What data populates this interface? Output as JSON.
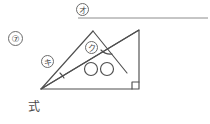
{
  "page": {
    "background_color": "#ffffff",
    "ink_color": "#4a4a4a",
    "width": 210,
    "height": 124
  },
  "answer_line": {
    "marker_label": "オ",
    "marker_name": "circled-katakana-o",
    "rule_x1": 78,
    "rule_x2": 208,
    "rule_y": 18
  },
  "problem": {
    "number_label": "⑦",
    "work_prompt_label": "式"
  },
  "figure": {
    "labels": [
      {
        "id": "ki",
        "text": "キ",
        "name": "circled-katakana-ki",
        "x": 47,
        "y": 61
      },
      {
        "id": "ku",
        "text": "ク",
        "name": "circled-katakana-ku",
        "x": 91,
        "y": 47
      }
    ],
    "vertices": {
      "bottom_left": [
        41,
        89
      ],
      "bottom_right": [
        139,
        89
      ],
      "top_right": [
        139,
        30
      ],
      "small_apex": [
        93,
        31
      ]
    },
    "marks": {
      "right_angle_at": "bottom_right",
      "angle_arc_at_bottom_left": true,
      "angle_arc_at_interior": true,
      "equal_tick_circles": 2
    }
  }
}
